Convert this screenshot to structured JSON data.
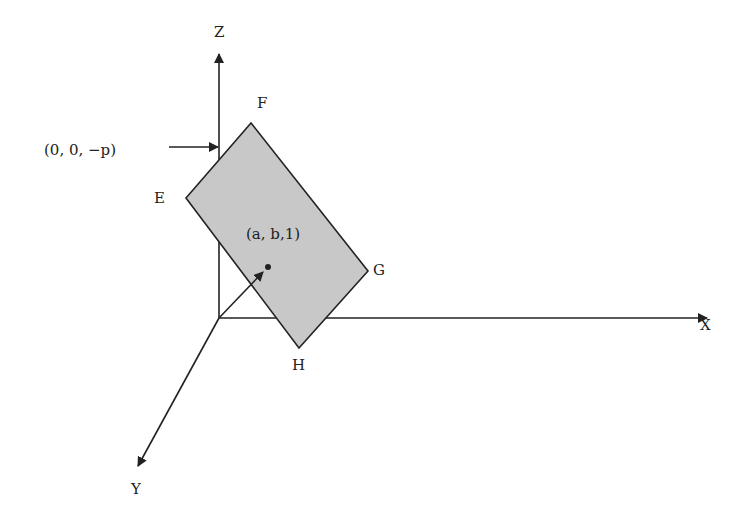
{
  "diagram": {
    "axes": {
      "x_label": "X",
      "y_label": "Y",
      "z_label": "Z"
    },
    "plane": {
      "corners": [
        "E",
        "F",
        "G",
        "H"
      ],
      "fill_color": "#c8c8c8",
      "center_point_label": "(a, b,1)"
    },
    "z_intercept_label": "(0, 0, −p)",
    "colors": {
      "stroke": "#222222",
      "background": "#ffffff"
    }
  }
}
